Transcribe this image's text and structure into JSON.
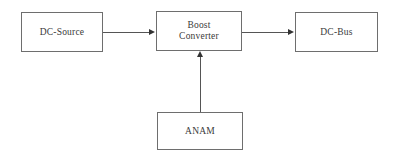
{
  "diagram": {
    "background_color": "#ffffff",
    "line_color": "#555555",
    "border_color": "#6e6e6e",
    "text_color": "#3a3a3a",
    "nodes": [
      {
        "id": "dc-source",
        "label": "DC-Source"
      },
      {
        "id": "boost-converter",
        "label": "Boost\nConverter"
      },
      {
        "id": "dc-bus",
        "label": "DC-Bus"
      },
      {
        "id": "anam",
        "label": "ANAM"
      }
    ],
    "edges": [
      {
        "id": "source-to-boost",
        "from": "dc-source",
        "to": "boost-converter",
        "direction": "right",
        "arrow": "arrow-right-icon"
      },
      {
        "id": "boost-to-bus",
        "from": "boost-converter",
        "to": "dc-bus",
        "direction": "right",
        "arrow": "arrow-right-icon"
      },
      {
        "id": "anam-to-boost",
        "from": "anam",
        "to": "boost-converter",
        "direction": "up",
        "arrow": "arrow-up-icon"
      }
    ]
  }
}
